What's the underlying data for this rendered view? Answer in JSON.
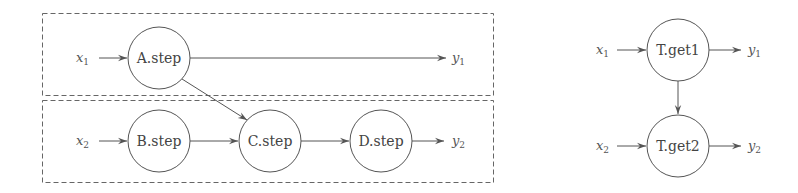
{
  "left_diagram": {
    "groups": [
      {
        "name": "group-1",
        "x": 42,
        "y": 13,
        "w": 451,
        "h": 82
      },
      {
        "name": "group-2",
        "x": 42,
        "y": 100,
        "w": 451,
        "h": 82
      }
    ],
    "nodes": [
      {
        "id": "A",
        "label": "A.step",
        "cx": 159,
        "cy": 58
      },
      {
        "id": "B",
        "label": "B.step",
        "cx": 159,
        "cy": 141
      },
      {
        "id": "C",
        "label": "C.step",
        "cx": 270,
        "cy": 141
      },
      {
        "id": "D",
        "label": "D.step",
        "cx": 381,
        "cy": 141
      }
    ],
    "inputs": [
      {
        "var": "x",
        "sub": "1",
        "x": 76,
        "y": 62
      },
      {
        "var": "x",
        "sub": "2",
        "x": 76,
        "y": 145
      }
    ],
    "outputs": [
      {
        "var": "y",
        "sub": "1",
        "x": 452,
        "y": 62
      },
      {
        "var": "y",
        "sub": "2",
        "x": 452,
        "y": 145
      }
    ]
  },
  "right_diagram": {
    "nodes": [
      {
        "id": "T1",
        "label": "T.get1",
        "cx": 678,
        "cy": 50
      },
      {
        "id": "T2",
        "label": "T.get2",
        "cx": 678,
        "cy": 146
      }
    ],
    "inputs": [
      {
        "var": "x",
        "sub": "1",
        "x": 596,
        "y": 54
      },
      {
        "var": "x",
        "sub": "2",
        "x": 596,
        "y": 150
      }
    ],
    "outputs": [
      {
        "var": "y",
        "sub": "1",
        "x": 748,
        "y": 54
      },
      {
        "var": "y",
        "sub": "2",
        "x": 748,
        "y": 150
      }
    ]
  }
}
